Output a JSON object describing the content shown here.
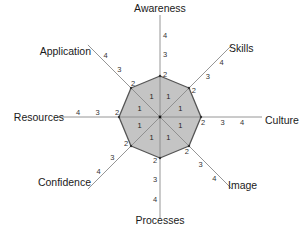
{
  "chart_data": {
    "type": "radar",
    "title": "",
    "axes": [
      "Awareness",
      "Skills",
      "Culture",
      "Image",
      "Processes",
      "Confidence",
      "Resources",
      "Application"
    ],
    "scale_ticks": [
      1,
      2,
      3,
      4
    ],
    "range": [
      0,
      4
    ],
    "series": [
      {
        "name": "profile",
        "values": [
          2,
          2,
          2,
          2,
          2,
          2,
          2,
          2
        ]
      }
    ],
    "colors": {
      "fill": "#c4c4c4",
      "stroke": "#555555",
      "axis": "#8a8a8a"
    },
    "grid": false,
    "legend": "none"
  }
}
